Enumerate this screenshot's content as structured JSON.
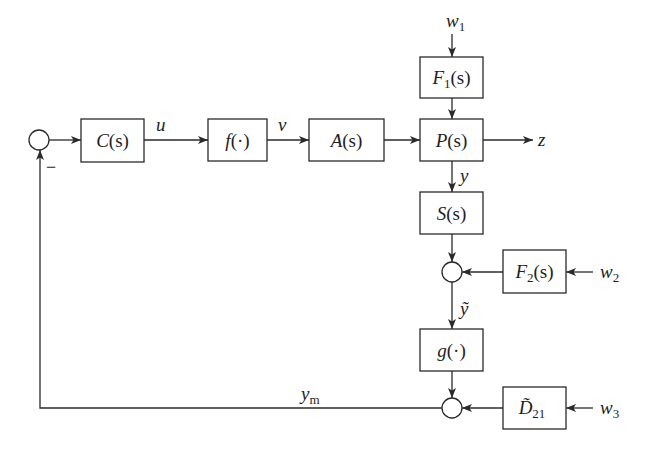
{
  "blocks": {
    "C": {
      "name": "C",
      "arg": "(s)"
    },
    "f": {
      "name": "f",
      "arg": "(·)"
    },
    "A": {
      "name": "A",
      "arg": "(s)"
    },
    "P": {
      "name": "P",
      "arg": "(s)"
    },
    "F1": {
      "name": "F",
      "sub": "1",
      "arg": "(s)"
    },
    "S": {
      "name": "S",
      "arg": "(s)"
    },
    "F2": {
      "name": "F",
      "sub": "2",
      "arg": "(s)"
    },
    "g": {
      "name": "g",
      "arg": "(·)"
    },
    "D21": {
      "name": "D̃",
      "sub": "21"
    }
  },
  "signals": {
    "u": {
      "name": "u"
    },
    "v": {
      "name": "v"
    },
    "z": {
      "name": "z"
    },
    "y": {
      "name": "y"
    },
    "y_tilde": {
      "name": "ỹ"
    },
    "y_m": {
      "name": "y",
      "sub": "m"
    },
    "w1": {
      "name": "w",
      "sub": "1"
    },
    "w2": {
      "name": "w",
      "sub": "2"
    },
    "w3": {
      "name": "w",
      "sub": "3"
    }
  },
  "summing_junctions": {
    "input": {
      "sign": "−"
    },
    "noise": {
      "sign": ""
    },
    "measurement": {
      "sign": ""
    }
  },
  "colors": {
    "line": "#2a2a2a",
    "background": "#ffffff"
  }
}
